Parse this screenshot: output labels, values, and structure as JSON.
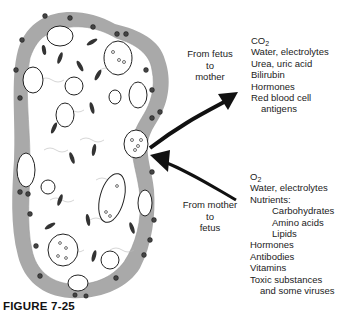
{
  "figure": {
    "caption": "FIGURE 7-25",
    "labels": {
      "fetus_to_mother": [
        "From fetus",
        "to",
        "mother"
      ],
      "mother_to_fetus": [
        "From mother",
        "to",
        "fetus"
      ]
    },
    "fetus_to_mother_list": {
      "first": {
        "base": "CO",
        "sub": "2"
      },
      "items": [
        {
          "text": "Water, electrolytes",
          "indent": 0
        },
        {
          "text": "Urea, uric acid",
          "indent": 0
        },
        {
          "text": "Bilirubin",
          "indent": 0
        },
        {
          "text": "Hormones",
          "indent": 0
        },
        {
          "text": "Red blood cell",
          "indent": 0
        },
        {
          "text": "antigens",
          "indent": 1
        }
      ]
    },
    "mother_to_fetus_list": {
      "first": {
        "base": "O",
        "sub": "2"
      },
      "items": [
        {
          "text": "Water, electrolytes",
          "indent": 0
        },
        {
          "text": "Nutrients:",
          "indent": 0
        },
        {
          "text": "Carbohydrates",
          "indent": 2
        },
        {
          "text": "Amino acids",
          "indent": 2
        },
        {
          "text": "Lipids",
          "indent": 2
        },
        {
          "text": "Hormones",
          "indent": 0
        },
        {
          "text": "Antibodies",
          "indent": 0
        },
        {
          "text": "Vitamins",
          "indent": 0
        },
        {
          "text": "Toxic substances",
          "indent": 0
        },
        {
          "text": "and some viruses",
          "indent": 1
        }
      ]
    },
    "colors": {
      "trophoblast": "#a9a9a9",
      "stroma": "#ffffff",
      "ink": "#111111"
    }
  }
}
